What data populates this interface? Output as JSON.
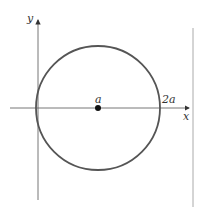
{
  "diagram": {
    "labels": {
      "y_axis": "y",
      "x_axis": "x",
      "center": "a",
      "right_intercept": "2a"
    },
    "colors": {
      "axis": "#555555",
      "circle": "#555555",
      "point": "#111111",
      "border": "#999999"
    }
  }
}
